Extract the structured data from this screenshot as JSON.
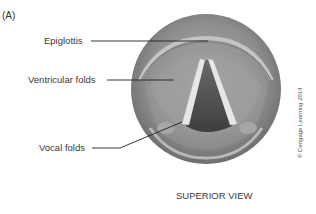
{
  "figure": {
    "panel_label": "(A)",
    "caption": "SUPERIOR VIEW",
    "copyright": "© Cengage Learning 2014",
    "labels": [
      {
        "id": "epiglottis",
        "text": "Epiglottis"
      },
      {
        "id": "ventricular-folds",
        "text": "Ventricular folds"
      },
      {
        "id": "vocal-folds",
        "text": "Vocal folds"
      }
    ]
  }
}
